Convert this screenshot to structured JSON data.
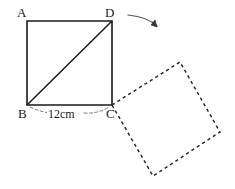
{
  "figure": {
    "stroke_color": "#1a1a1a",
    "dashed_color": "#2b2b2b",
    "background": "#ffffff",
    "width": 235,
    "height": 189
  },
  "labels": {
    "a": "A",
    "b": "B",
    "c": "C",
    "d": "D"
  },
  "dimension": {
    "side_bc": "12cm"
  },
  "geometry": {
    "solid_square": {
      "a": [
        27,
        21
      ],
      "b": [
        27,
        105
      ],
      "c": [
        112,
        105
      ],
      "d": [
        112,
        21
      ],
      "diagonal": "B-D"
    },
    "dashed_square": {
      "p1": [
        112,
        105
      ],
      "p2": [
        180,
        62
      ],
      "p3": [
        220,
        132
      ],
      "p4": [
        153,
        176
      ]
    },
    "rotation_arrow": {
      "start": [
        128,
        15
      ],
      "control": [
        150,
        18
      ],
      "end": [
        158,
        27
      ]
    },
    "dimension_arc": {
      "start": [
        29,
        108
      ],
      "end": [
        110,
        108
      ],
      "sag": 6
    }
  },
  "icons": {
    "rotation_arrow": "curved-arrow-icon"
  }
}
